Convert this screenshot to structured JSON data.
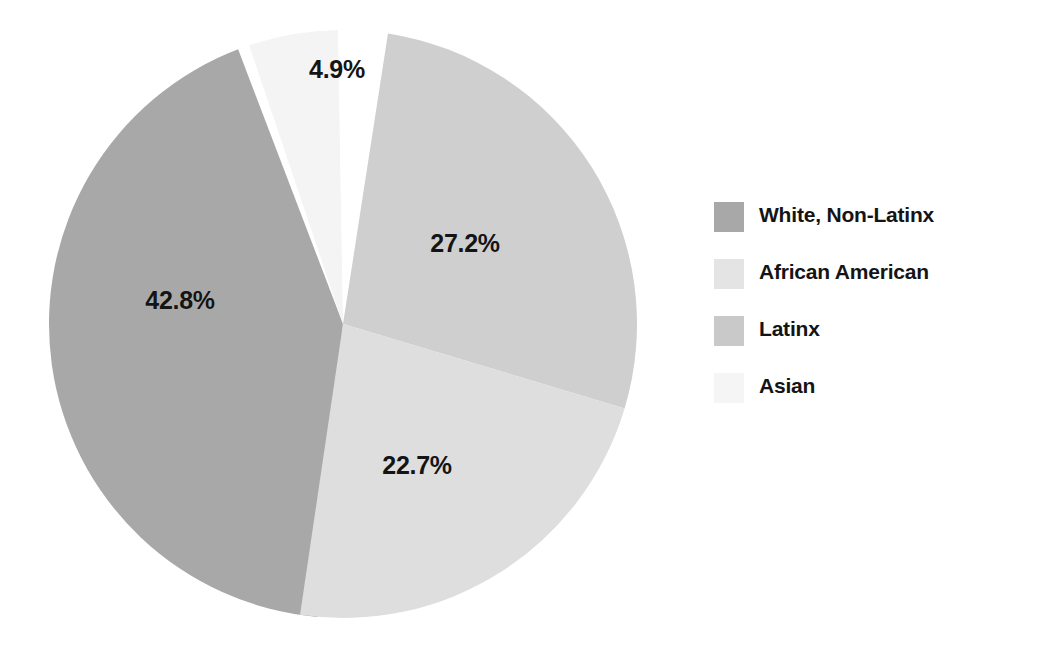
{
  "chart_data": {
    "type": "pie",
    "title": "",
    "subtitle": "",
    "xlabel": "",
    "ylabel": "",
    "grid": false,
    "legend_position": "right",
    "categories": [
      "White, Non-Latinx",
      "African American",
      "Latinx",
      "Asian"
    ],
    "values": [
      42.8,
      27.2,
      22.7,
      4.9
    ],
    "value_labels": [
      "42.8%",
      "27.2%",
      "22.7%",
      "4.9%"
    ],
    "value_unit": "%",
    "slice_colors": [
      "#a8a8a8",
      "#cfcfcf",
      "#dedede",
      "#f4f4f4"
    ],
    "separator_color": "#ffffff",
    "background_color": "#ffffff",
    "label_color": "#141414",
    "slices": [
      {
        "name": "White, Non-Latinx",
        "value": 42.8,
        "label": "42.8%",
        "color": "#a8a8a8",
        "start_angle_deg": 185.0,
        "end_angle_deg": 339.1,
        "label_x": 180,
        "label_y": 300
      },
      {
        "name": "African American",
        "value": 27.2,
        "label": "27.2%",
        "color": "#cfcfcf",
        "start_angle_deg": 8.8,
        "end_angle_deg": 106.7,
        "label_x": 465,
        "label_y": 243
      },
      {
        "name": "Latinx",
        "value": 22.7,
        "label": "22.7%",
        "color": "#dedede",
        "start_angle_deg": 106.7,
        "end_angle_deg": 188.4,
        "label_x": 417,
        "label_y": 465
      },
      {
        "name": "Asian",
        "value": 4.9,
        "label": "4.9%",
        "color": "#f4f4f4",
        "start_angle_deg": 341.4,
        "end_angle_deg": 359.0,
        "label_x": 337,
        "label_y": 69
      }
    ],
    "geometry": {
      "center_x": 343,
      "center_y": 324,
      "radius": 294
    }
  },
  "legend": {
    "items": [
      {
        "label": "White, Non-Latinx",
        "color": "#a8a8a8"
      },
      {
        "label": "African American",
        "color": "#e4e4e4"
      },
      {
        "label": "Latinx",
        "color": "#c9c9c9"
      },
      {
        "label": "Asian",
        "color": "#f5f5f5"
      }
    ]
  }
}
